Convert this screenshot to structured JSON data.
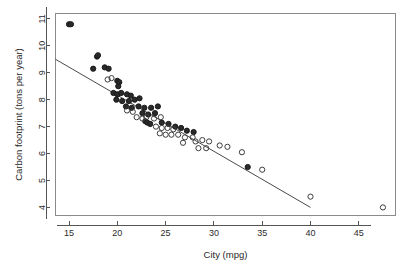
{
  "chart_data": {
    "type": "scatter",
    "title": "",
    "xlabel": "City (mpg)",
    "ylabel": "Carbon footprint (tons per year)",
    "xlim": [
      13.6,
      48.8
    ],
    "ylim": [
      3.7,
      11.2
    ],
    "xticks": [
      15,
      20,
      25,
      30,
      35,
      40,
      45
    ],
    "yticks": [
      4,
      5,
      6,
      7,
      8,
      9,
      10,
      11
    ],
    "grid": false,
    "legend": "none",
    "series": [
      {
        "name": "filled",
        "marker": "filled-circle",
        "color": "#2a2a2a",
        "points": [
          [
            15.0,
            10.8
          ],
          [
            15.2,
            10.8
          ],
          [
            17.9,
            9.6
          ],
          [
            18.0,
            9.65
          ],
          [
            17.5,
            9.15
          ],
          [
            18.7,
            9.2
          ],
          [
            19.1,
            9.15
          ],
          [
            20.0,
            8.7
          ],
          [
            20.2,
            8.65
          ],
          [
            20.1,
            8.5
          ],
          [
            19.6,
            8.25
          ],
          [
            20.0,
            8.2
          ],
          [
            20.4,
            8.25
          ],
          [
            21.0,
            8.2
          ],
          [
            21.4,
            8.15
          ],
          [
            19.9,
            8.0
          ],
          [
            20.5,
            7.95
          ],
          [
            21.2,
            7.95
          ],
          [
            21.8,
            8.0
          ],
          [
            22.3,
            8.05
          ],
          [
            20.9,
            7.75
          ],
          [
            21.5,
            7.7
          ],
          [
            22.2,
            7.75
          ],
          [
            22.8,
            7.7
          ],
          [
            23.5,
            7.7
          ],
          [
            24.2,
            7.75
          ],
          [
            22.6,
            7.5
          ],
          [
            23.2,
            7.45
          ],
          [
            23.9,
            7.5
          ],
          [
            22.9,
            7.2
          ],
          [
            23.1,
            7.15
          ],
          [
            23.4,
            7.1
          ],
          [
            24.6,
            7.15
          ],
          [
            25.3,
            7.1
          ],
          [
            26.0,
            7.0
          ],
          [
            26.6,
            6.95
          ],
          [
            27.2,
            6.85
          ],
          [
            27.9,
            6.8
          ],
          [
            33.5,
            5.5
          ]
        ]
      },
      {
        "name": "open",
        "marker": "open-circle",
        "color": "#3d3d3d",
        "points": [
          [
            19.0,
            8.75
          ],
          [
            19.4,
            8.8
          ],
          [
            21.0,
            7.6
          ],
          [
            21.6,
            7.55
          ],
          [
            22.0,
            7.35
          ],
          [
            22.6,
            7.3
          ],
          [
            23.0,
            7.35
          ],
          [
            23.8,
            7.3
          ],
          [
            24.5,
            7.35
          ],
          [
            24.0,
            7.0
          ],
          [
            24.6,
            6.95
          ],
          [
            25.2,
            6.95
          ],
          [
            25.8,
            6.9
          ],
          [
            24.4,
            6.75
          ],
          [
            25.0,
            6.7
          ],
          [
            25.6,
            6.7
          ],
          [
            26.3,
            6.7
          ],
          [
            27.0,
            6.6
          ],
          [
            27.8,
            6.6
          ],
          [
            26.8,
            6.4
          ],
          [
            28.1,
            6.45
          ],
          [
            28.8,
            6.5
          ],
          [
            29.5,
            6.45
          ],
          [
            28.4,
            6.2
          ],
          [
            29.2,
            6.2
          ],
          [
            30.6,
            6.3
          ],
          [
            31.4,
            6.25
          ],
          [
            32.9,
            6.05
          ],
          [
            35.0,
            5.4
          ],
          [
            40.0,
            4.4
          ],
          [
            47.5,
            4.0
          ]
        ]
      }
    ],
    "fit_line": {
      "name": "regression-line",
      "x_start": 13.6,
      "y_start": 9.5,
      "x_end": 40.0,
      "y_end": 4.0
    }
  }
}
